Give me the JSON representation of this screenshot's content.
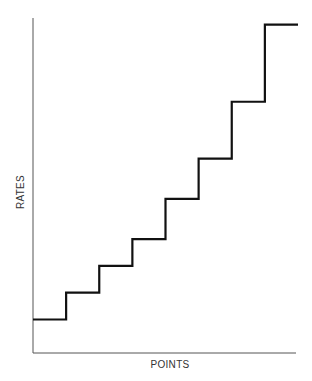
{
  "chart_data": {
    "type": "line",
    "subtype": "step",
    "title": "",
    "xlabel": "POINTS",
    "ylabel": "RATES",
    "grid": false,
    "legend": null,
    "x_ticks": [],
    "y_ticks": [],
    "series": [
      {
        "name": "rates",
        "x": [
          0,
          1,
          2,
          3,
          4,
          5,
          6,
          7,
          8
        ],
        "values": [
          1.0,
          1.8,
          2.6,
          3.4,
          4.6,
          5.8,
          7.5,
          9.8,
          9.8
        ]
      }
    ],
    "xlim": [
      0,
      8
    ],
    "ylim": [
      0,
      10
    ]
  },
  "colors": {
    "axis": "#555555",
    "line": "#111111",
    "text": "#333333",
    "background": "#ffffff"
  }
}
